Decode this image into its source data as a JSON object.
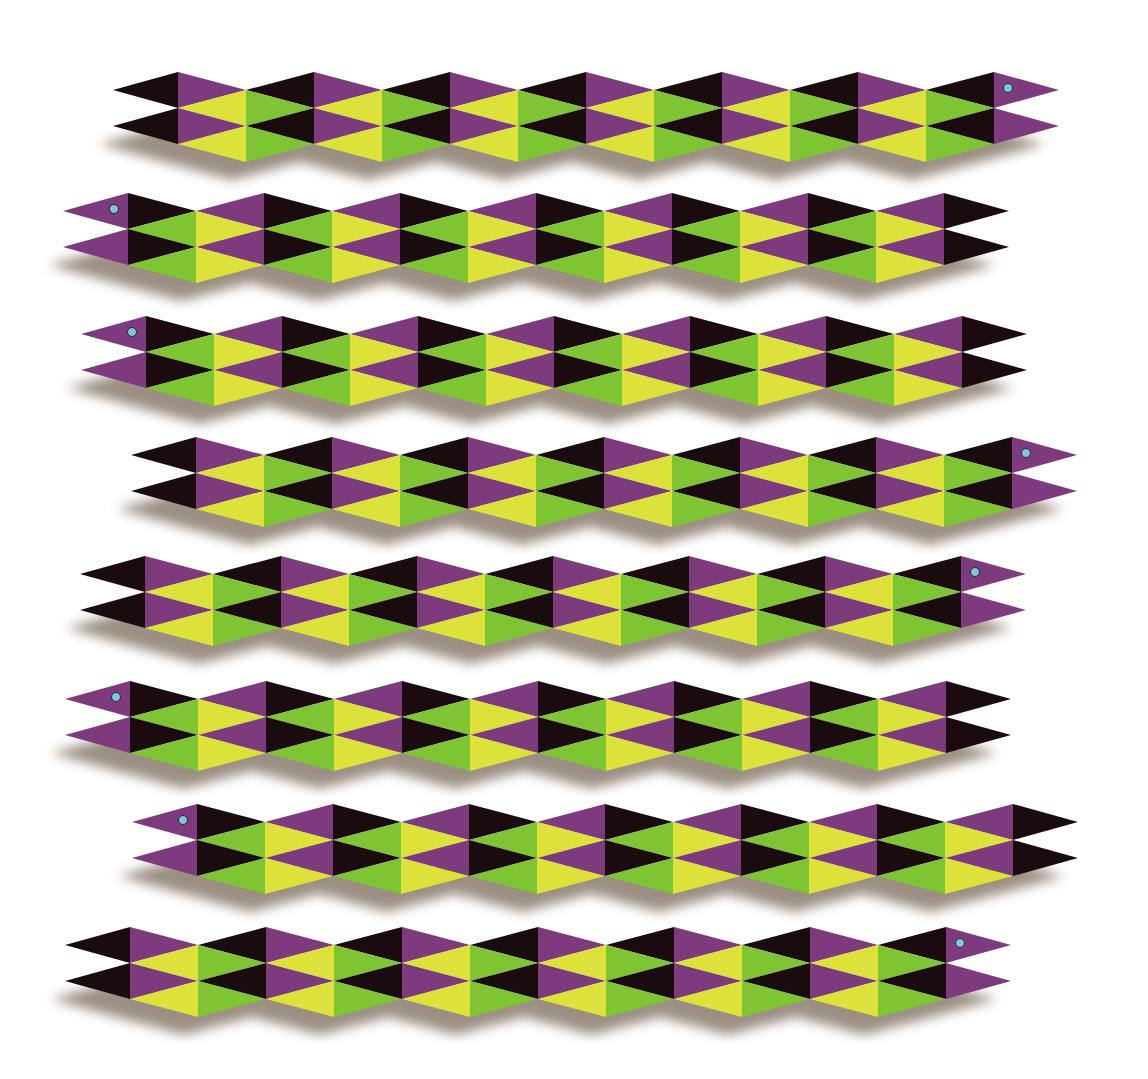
{
  "artwork": {
    "title": "Snakes illusion",
    "background": "#ffffff",
    "colors": {
      "purple": "#7d3b7e",
      "black": "#1a0c0e",
      "yellow": "#dde23a",
      "green": "#7ec433",
      "eye": "#7fc6d4",
      "eye_outline": "#1d2b3a",
      "shadow": "#7a6a5a"
    },
    "segment_width": 68,
    "zigzag_depth": 18,
    "band_height": 36,
    "segments_per_snake": 12,
    "tip_length": 65
  },
  "snakes": [
    {
      "name": "snake-1",
      "first_column_x": 178,
      "peak_y": 72,
      "head": "right"
    },
    {
      "name": "snake-2",
      "first_column_x": 128,
      "peak_y": 193,
      "head": "left"
    },
    {
      "name": "snake-3",
      "first_column_x": 146,
      "peak_y": 316,
      "head": "left"
    },
    {
      "name": "snake-4",
      "first_column_x": 196,
      "peak_y": 437,
      "head": "right"
    },
    {
      "name": "snake-5",
      "first_column_x": 145,
      "peak_y": 556,
      "head": "right"
    },
    {
      "name": "snake-6",
      "first_column_x": 130,
      "peak_y": 681,
      "head": "left"
    },
    {
      "name": "snake-7",
      "first_column_x": 197,
      "peak_y": 804,
      "head": "left"
    },
    {
      "name": "snake-8",
      "first_column_x": 130,
      "peak_y": 927,
      "head": "right"
    }
  ]
}
